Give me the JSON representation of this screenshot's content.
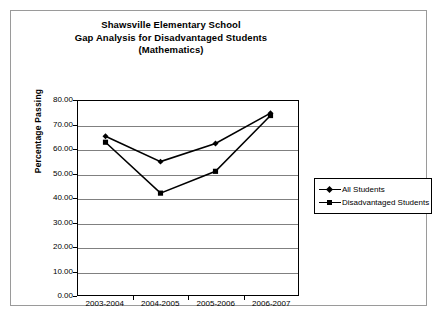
{
  "chart_data": {
    "type": "line",
    "title": "Shawsville Elementary School\nGap Analysis for Disadvantaged Students\n(Mathematics)",
    "title_lines": [
      "Shawsville Elementary School",
      "Gap Analysis for Disadvantaged Students",
      "(Mathematics)"
    ],
    "xlabel": "",
    "ylabel": "Percentage Passing",
    "categories": [
      "2003-2004",
      "2004-2005",
      "2005-2006",
      "2006-2007"
    ],
    "series": [
      {
        "name": "All Students",
        "marker": "diamond",
        "color": "#000000",
        "values": [
          65.5,
          55.0,
          62.5,
          75.0
        ]
      },
      {
        "name": "Disadvantaged Students",
        "marker": "square",
        "color": "#000000",
        "values": [
          63.0,
          42.0,
          51.0,
          74.0
        ]
      }
    ],
    "ylim": [
      0,
      80
    ],
    "ytick_step": 10,
    "ytick_labels": [
      "80.00",
      "70.00",
      "60.00",
      "50.00",
      "40.00",
      "30.00",
      "20.00",
      "10.00",
      "0.00"
    ],
    "ytick_values": [
      80,
      70,
      60,
      50,
      40,
      30,
      20,
      10,
      0
    ],
    "grid": "horizontal",
    "legend_position": "right",
    "plot_background": "#ffffff",
    "gridline_color": "#808080",
    "axis_color": "#000000",
    "frame_color": "#9a9a9a"
  },
  "legend": {
    "items": [
      {
        "label": "All Students",
        "marker": "diamond-marker"
      },
      {
        "label": "Disadvantaged Students",
        "marker": "square-marker"
      }
    ]
  }
}
